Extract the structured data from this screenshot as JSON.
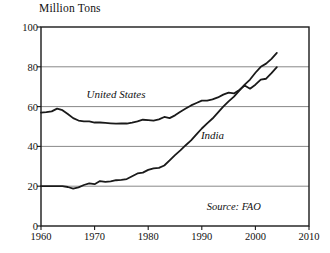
{
  "chart_data": {
    "type": "line",
    "title": "",
    "ylabel": "Million Tons",
    "xlabel": "",
    "xlim": [
      1960,
      2010
    ],
    "ylim": [
      0,
      100
    ],
    "xticks": [
      1960,
      1970,
      1980,
      1990,
      2000,
      2010
    ],
    "yticks": [
      0,
      20,
      40,
      60,
      80,
      100
    ],
    "grid": "horizontal",
    "legend_position": "inline-annotations",
    "annotations": [
      {
        "text": "United States",
        "x": 1974,
        "y": 66
      },
      {
        "text": "India",
        "x": 1992,
        "y": 45
      },
      {
        "text": "Source: FAO",
        "x": 2001,
        "y": 9
      }
    ],
    "series": [
      {
        "name": "United States",
        "color": "#1a1a1a",
        "x": [
          1960,
          1961,
          1962,
          1963,
          1964,
          1965,
          1966,
          1967,
          1968,
          1969,
          1970,
          1971,
          1972,
          1973,
          1974,
          1975,
          1976,
          1977,
          1978,
          1979,
          1980,
          1981,
          1982,
          1983,
          1984,
          1985,
          1986,
          1987,
          1988,
          1989,
          1990,
          1991,
          1992,
          1993,
          1994,
          1995,
          1996,
          1997,
          1998,
          1999,
          2000,
          2001,
          2002,
          2003,
          2004
        ],
        "values": [
          57.0,
          57.2,
          57.6,
          59.0,
          58.2,
          56.3,
          54.2,
          53.0,
          52.6,
          52.6,
          52.0,
          52.0,
          51.8,
          51.6,
          51.4,
          51.6,
          51.5,
          52.0,
          52.6,
          53.4,
          53.2,
          53.0,
          53.6,
          54.8,
          54.2,
          55.6,
          57.4,
          59.0,
          60.6,
          61.8,
          63.0,
          63.0,
          63.6,
          64.6,
          66.0,
          67.0,
          66.6,
          68.4,
          70.6,
          69.0,
          71.0,
          73.6,
          74.0,
          76.8,
          79.8
        ]
      },
      {
        "name": "India",
        "color": "#1a1a1a",
        "x": [
          1960,
          1961,
          1962,
          1963,
          1964,
          1965,
          1966,
          1967,
          1968,
          1969,
          1970,
          1971,
          1972,
          1973,
          1974,
          1975,
          1976,
          1977,
          1978,
          1979,
          1980,
          1981,
          1982,
          1983,
          1984,
          1985,
          1986,
          1987,
          1988,
          1989,
          1990,
          1991,
          1992,
          1993,
          1994,
          1995,
          1996,
          1997,
          1998,
          1999,
          2000,
          2001,
          2002,
          2003,
          2004
        ],
        "values": [
          20.0,
          20.0,
          20.0,
          20.0,
          20.0,
          19.6,
          18.8,
          19.4,
          20.6,
          21.4,
          21.0,
          22.6,
          22.2,
          22.4,
          23.0,
          23.2,
          23.6,
          25.0,
          26.4,
          26.8,
          28.2,
          29.0,
          29.2,
          30.4,
          33.0,
          35.6,
          38.0,
          40.6,
          43.0,
          46.0,
          49.0,
          51.6,
          54.0,
          57.0,
          60.0,
          62.6,
          65.0,
          68.0,
          71.0,
          73.6,
          77.0,
          80.0,
          81.6,
          84.0,
          87.0
        ]
      }
    ]
  },
  "axes": {
    "y_title": "Million Tons",
    "y_tick_labels": [
      "0",
      "20",
      "40",
      "60",
      "80",
      "100"
    ],
    "x_tick_labels": [
      "1960",
      "1970",
      "1980",
      "1990",
      "2000",
      "2010"
    ]
  },
  "labels": {
    "united_states": "United States",
    "india": "India",
    "source": "Source: FAO"
  },
  "colors": {
    "line": "#1a1a1a",
    "grid": "#7a7a7a",
    "frame": "#1a1a1a",
    "background": "#ffffff"
  }
}
